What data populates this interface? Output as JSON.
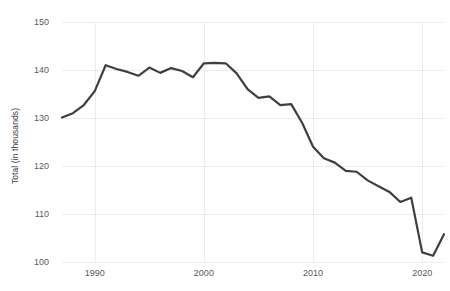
{
  "chart_data": {
    "type": "line",
    "title": "",
    "xlabel": "",
    "ylabel": "Total (in thousands)",
    "xlim": [
      1987,
      2022
    ],
    "ylim": [
      100,
      150
    ],
    "grid": true,
    "legend": "none",
    "line_color": "#3f3f3f",
    "grid_color": "#ececed",
    "tick_color": "#595959",
    "yticks": [
      150,
      140,
      130,
      120,
      110,
      100
    ],
    "xticks": [
      1990,
      2000,
      2010,
      2020
    ],
    "series": [
      {
        "name": "Total",
        "x": [
          1987,
          1988,
          1989,
          1990,
          1991,
          1992,
          1993,
          1994,
          1995,
          1996,
          1997,
          1998,
          1999,
          2000,
          2001,
          2002,
          2003,
          2004,
          2005,
          2006,
          2007,
          2008,
          2009,
          2010,
          2011,
          2012,
          2013,
          2014,
          2015,
          2016,
          2017,
          2018,
          2019,
          2020,
          2021,
          2022
        ],
        "values": [
          130.1,
          131.0,
          132.7,
          135.6,
          141.0,
          140.2,
          139.6,
          138.8,
          140.5,
          139.4,
          140.4,
          139.8,
          138.5,
          141.4,
          141.5,
          141.4,
          139.3,
          136.0,
          134.2,
          134.5,
          132.7,
          132.9,
          129.0,
          124.0,
          121.6,
          120.7,
          119.0,
          118.8,
          117.0,
          115.8,
          114.6,
          112.5,
          113.4,
          102.0,
          101.3,
          105.8
        ]
      }
    ]
  }
}
